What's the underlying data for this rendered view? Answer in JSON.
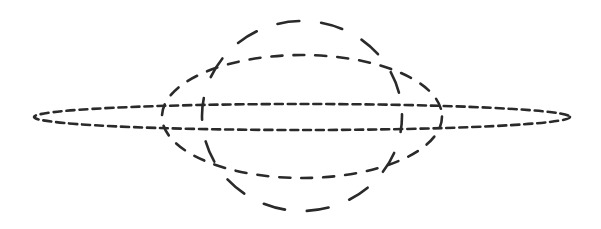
{
  "diagram": {
    "title": "",
    "stroke_color": "#2a2a2a",
    "background_color": "#ffffff",
    "shapes": [
      {
        "id": "thin-horizontal-ellipse",
        "kind": "ellipse",
        "dash_style": "short-dash"
      },
      {
        "id": "medium-ellipse",
        "kind": "ellipse",
        "dash_style": "medium-dash"
      },
      {
        "id": "tall-vertical-ellipse",
        "kind": "ellipse",
        "dash_style": "long-dash"
      }
    ]
  }
}
